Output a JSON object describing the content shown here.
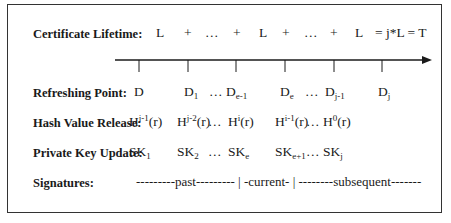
{
  "diagram": {
    "type": "certificate-lifetime-timeline",
    "rows": {
      "certificate_lifetime": {
        "label": "Certificate Lifetime:",
        "terms": [
          "L",
          "+",
          "…",
          "+",
          "L",
          "+",
          "…",
          "+",
          "L",
          "= j*L = T"
        ]
      },
      "refreshing_point": {
        "label": "Refreshing Point:",
        "points": [
          {
            "base": "D",
            "sub": ""
          },
          {
            "base": "D",
            "sub": "1"
          },
          {
            "base": "D",
            "sub": "e-1"
          },
          {
            "base": "D",
            "sub": "e"
          },
          {
            "base": "D",
            "sub": "j-1"
          },
          {
            "base": "D",
            "sub": "j"
          }
        ],
        "ellipsis": "…"
      },
      "hash_value_release": {
        "label": "Hash Value Release:",
        "values": [
          {
            "base": "H",
            "sup": "j-1",
            "arg": "(r)"
          },
          {
            "base": "H",
            "sup": "j-2",
            "arg": "(r)"
          },
          {
            "base": "H",
            "sup": "i",
            "arg": "(r)"
          },
          {
            "base": "H",
            "sup": "i-1",
            "arg": "(r)"
          },
          {
            "base": "H",
            "sup": "0",
            "arg": "(r)"
          }
        ],
        "ellipsis": "…"
      },
      "private_key_update": {
        "label": "Private Key Update:",
        "keys": [
          {
            "base": "SK",
            "sub": "1"
          },
          {
            "base": "SK",
            "sub": "2"
          },
          {
            "base": "SK",
            "sub": "e"
          },
          {
            "base": "SK",
            "sub": "e+1"
          },
          {
            "base": "SK",
            "sub": "j"
          }
        ],
        "ellipsis": "…"
      },
      "signatures": {
        "label": "Signatures:",
        "text": "---------past--------- | -current- | --------subsequent-------"
      }
    },
    "timeline": {
      "ticks": 6,
      "arrow": "right"
    },
    "colors": {
      "line": "#1a1a1a",
      "border": "#333333",
      "background": "#ffffff"
    }
  }
}
